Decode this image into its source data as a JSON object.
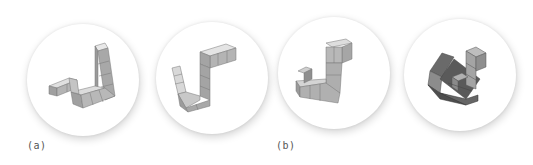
{
  "figure": {
    "panels": [
      {
        "id": "a",
        "label": "(a)",
        "shapes": [
          "cube-polycube-view-1",
          "cube-polycube-view-2"
        ]
      },
      {
        "id": "b",
        "label": "(b)",
        "shapes": [
          "cube-polycube-view-3",
          "cube-polycube-view-4"
        ]
      }
    ],
    "colors": {
      "background": "#ffffff",
      "disc": "#ffffff",
      "cube_top": "#e6e6e6",
      "cube_left": "#b8b8b8",
      "cube_right": "#9a9a9a",
      "cube_dark": "#555555",
      "label": "#555555"
    }
  }
}
